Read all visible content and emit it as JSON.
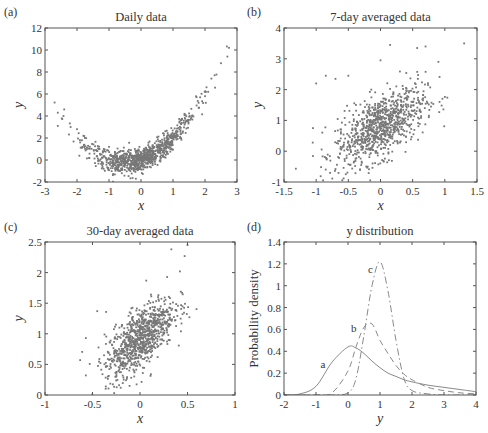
{
  "figure": {
    "panels": [
      {
        "id": "a",
        "label": "(a)",
        "title": "Daily data",
        "xlabel": "x",
        "ylabel": "y"
      },
      {
        "id": "b",
        "label": "(b)",
        "title": "7-day averaged data",
        "xlabel": "x",
        "ylabel": "y"
      },
      {
        "id": "c",
        "label": "(c)",
        "title": "30-day averaged data",
        "xlabel": "x",
        "ylabel": "y"
      },
      {
        "id": "d",
        "label": "(d)",
        "title": "y distribution",
        "xlabel": "y",
        "ylabel": "Probability density"
      }
    ]
  },
  "chart_data": [
    {
      "panel": "(a)",
      "type": "scatter",
      "title": "Daily data",
      "xlabel": "x",
      "ylabel": "y",
      "xlim": [
        -3,
        3
      ],
      "ylim": [
        -2,
        12
      ],
      "xticks": [
        -3,
        -2,
        -1,
        0,
        1,
        2,
        3
      ],
      "yticks": [
        -2,
        0,
        2,
        4,
        6,
        8,
        10,
        12
      ],
      "grid": false,
      "marker_color": "#777777",
      "relationship": "quadratic, y ≈ x^2 + x with noise; minimum near x≈-0.5, y≈-0.3",
      "sample_points": [
        [
          -2.6,
          4.3
        ],
        [
          -2.6,
          3.1
        ],
        [
          -2.4,
          4.6
        ],
        [
          -2.2,
          3.0
        ],
        [
          -2.0,
          2.8
        ],
        [
          -1.8,
          2.2
        ],
        [
          -1.6,
          1.2
        ],
        [
          -1.4,
          0.9
        ],
        [
          -1.2,
          0.2
        ],
        [
          -1.0,
          0.1
        ],
        [
          -0.8,
          -0.5
        ],
        [
          -0.6,
          -1.2
        ],
        [
          -0.5,
          -0.3
        ],
        [
          -0.3,
          -0.4
        ],
        [
          0.0,
          0.0
        ],
        [
          0.2,
          0.3
        ],
        [
          0.4,
          0.8
        ],
        [
          0.6,
          1.0
        ],
        [
          0.8,
          1.5
        ],
        [
          1.0,
          2.0
        ],
        [
          1.2,
          2.8
        ],
        [
          1.4,
          3.5
        ],
        [
          1.6,
          4.0
        ],
        [
          1.8,
          5.2
        ],
        [
          2.0,
          5.8
        ],
        [
          2.1,
          6.2
        ],
        [
          2.2,
          7.4
        ],
        [
          2.3,
          7.7
        ],
        [
          2.5,
          8.8
        ],
        [
          2.7,
          9.4
        ],
        [
          2.75,
          10.2
        ]
      ],
      "n_points_approx": 1000
    },
    {
      "panel": "(b)",
      "type": "scatter",
      "title": "7-day averaged data",
      "xlabel": "x",
      "ylabel": "y",
      "xlim": [
        -1.5,
        1.5
      ],
      "ylim": [
        -1,
        4
      ],
      "xticks": [
        -1.5,
        -1,
        -0.5,
        0,
        0.5,
        1,
        1.5
      ],
      "yticks": [
        -1,
        0,
        1,
        2,
        3,
        4
      ],
      "grid": false,
      "marker_color": "#777777",
      "relationship": "positive correlation, cloud centered near (0, 0.8)",
      "sample_points": [
        [
          -1.05,
          0.75
        ],
        [
          -1.0,
          2.2
        ],
        [
          -0.85,
          2.45
        ],
        [
          -0.7,
          2.35
        ],
        [
          -0.5,
          2.45
        ],
        [
          -0.3,
          -0.45
        ],
        [
          0.15,
          3.45
        ],
        [
          0.0,
          2.95
        ],
        [
          0.57,
          3.35
        ],
        [
          0.7,
          3.4
        ],
        [
          1.3,
          3.5
        ],
        [
          0.9,
          2.9
        ],
        [
          -0.2,
          0.4
        ],
        [
          0.0,
          0.9
        ],
        [
          0.3,
          1.3
        ],
        [
          0.5,
          1.6
        ],
        [
          -0.5,
          0.3
        ],
        [
          0.2,
          0.7
        ]
      ],
      "n_points_approx": 1000
    },
    {
      "panel": "(c)",
      "type": "scatter",
      "title": "30-day averaged data",
      "xlabel": "x",
      "ylabel": "y",
      "xlim": [
        -1,
        1
      ],
      "ylim": [
        0,
        2.5
      ],
      "xticks": [
        -1,
        -0.5,
        0,
        0.5,
        1
      ],
      "yticks": [
        0,
        0.5,
        1,
        1.5,
        2,
        2.5
      ],
      "grid": false,
      "marker_color": "#777777",
      "relationship": "positive correlation, cloud centered near (0, 0.95)",
      "sample_points": [
        [
          -0.63,
          0.57
        ],
        [
          -0.57,
          0.32
        ],
        [
          -0.57,
          0.93
        ],
        [
          -0.45,
          1.37
        ],
        [
          -0.36,
          0.14
        ],
        [
          -0.22,
          0.16
        ],
        [
          0.0,
          0.9
        ],
        [
          0.1,
          1.2
        ],
        [
          0.33,
          2.38
        ],
        [
          0.47,
          2.27
        ],
        [
          0.5,
          2.45
        ],
        [
          0.52,
          1.27
        ],
        [
          0.42,
          2.02
        ],
        [
          -0.2,
          0.6
        ],
        [
          0.2,
          1.3
        ]
      ],
      "n_points_approx": 1000
    },
    {
      "panel": "(d)",
      "type": "line",
      "title": "y distribution",
      "xlabel": "y",
      "ylabel": "Probability density",
      "xlim": [
        -2,
        4
      ],
      "ylim": [
        0,
        1.4
      ],
      "xticks": [
        -2,
        -1,
        0,
        1,
        2,
        3,
        4
      ],
      "yticks": [
        0,
        0.2,
        0.4,
        0.6,
        0.8,
        1,
        1.2,
        1.4
      ],
      "grid": false,
      "annotations": [
        "a",
        "b",
        "c"
      ],
      "x": [
        -2,
        -1.5,
        -1,
        -0.5,
        0,
        0.25,
        0.5,
        0.75,
        1,
        1.25,
        1.5,
        1.75,
        2,
        2.5,
        3,
        3.5,
        4
      ],
      "series": [
        {
          "name": "a",
          "style": "solid",
          "values": [
            0.0,
            0.01,
            0.08,
            0.3,
            0.44,
            0.43,
            0.38,
            0.31,
            0.25,
            0.2,
            0.17,
            0.14,
            0.12,
            0.09,
            0.07,
            0.05,
            0.03
          ]
        },
        {
          "name": "b",
          "style": "dashed",
          "values": [
            0.0,
            0.0,
            0.0,
            0.02,
            0.22,
            0.44,
            0.62,
            0.65,
            0.5,
            0.38,
            0.27,
            0.19,
            0.14,
            0.07,
            0.04,
            0.02,
            0.01
          ]
        },
        {
          "name": "c",
          "style": "dash-dot",
          "values": [
            0.0,
            0.0,
            0.0,
            0.0,
            0.02,
            0.15,
            0.55,
            1.0,
            1.22,
            0.95,
            0.5,
            0.15,
            0.04,
            0.01,
            0.0,
            0.0,
            0.0
          ]
        }
      ]
    }
  ]
}
